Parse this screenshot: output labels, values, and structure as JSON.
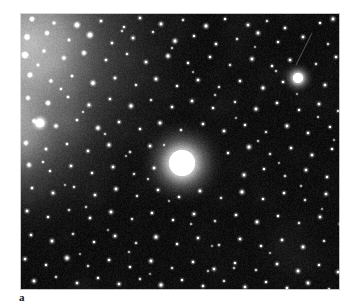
{
  "figure": {
    "panel_label": "a",
    "caption_visible": false,
    "background_color": "#ffffff"
  },
  "plate": {
    "kind": "astronomical-image",
    "frame": {
      "x": 20,
      "y": 13,
      "width": 320,
      "height": 277
    },
    "sky_background_color": "#070707",
    "star_color": "#ffffff",
    "nebulosity_color": "#8a8a8a",
    "border_color": "#d6d6d6"
  },
  "chart_data": {
    "type": "scatter",
    "title": "",
    "subtitle": "",
    "xlabel": "",
    "ylabel": "",
    "grid": false,
    "legend": null,
    "xlim": [
      0,
      320
    ],
    "ylim": [
      0,
      277
    ],
    "annotations": [
      {
        "text": "a",
        "x": 0,
        "y": -14,
        "role": "panel-label"
      }
    ],
    "background_glow": {
      "description": "broad diffuse nebulous glow in upper-left corner fading toward image centre",
      "center_x": 10,
      "center_y": 28,
      "radius": 185,
      "peak_gray": 168
    },
    "edge_glow": {
      "description": "secondary faint glow along left edge",
      "center_x": -10,
      "center_y": 120,
      "radius": 130,
      "peak_gray": 118
    },
    "streak": {
      "description": "faint linear trail (satellite or cosmic-ray) near top-right",
      "x1": 292,
      "y1": 20,
      "x2": 276,
      "y2": 52,
      "gray": 110,
      "width": 1.1
    },
    "extended_objects": [
      {
        "name": "central-bright-fuzzy-object",
        "x": 162,
        "y": 150,
        "core_radius": 13,
        "halo_radius": 46,
        "peak_gray": 255
      },
      {
        "name": "bright-star-upper-right",
        "x": 278,
        "y": 65,
        "core_radius": 5,
        "halo_radius": 17,
        "peak_gray": 255
      },
      {
        "name": "bright-star-left-edge",
        "x": 20,
        "y": 110,
        "core_radius": 3,
        "halo_radius": 10,
        "peak_gray": 235
      }
    ],
    "stars": [
      [
        12,
        6,
        1.3,
        200
      ],
      [
        34,
        10,
        1.0,
        170
      ],
      [
        57,
        12,
        1.6,
        230
      ],
      [
        81,
        8,
        1.1,
        180
      ],
      [
        104,
        14,
        1.0,
        160
      ],
      [
        120,
        5,
        1.2,
        190
      ],
      [
        141,
        11,
        1.4,
        210
      ],
      [
        163,
        7,
        1.0,
        165
      ],
      [
        186,
        13,
        1.5,
        225
      ],
      [
        205,
        6,
        1.1,
        175
      ],
      [
        228,
        12,
        1.3,
        200
      ],
      [
        247,
        8,
        1.0,
        160
      ],
      [
        265,
        15,
        1.2,
        185
      ],
      [
        300,
        10,
        1.1,
        175
      ],
      [
        313,
        6,
        1.4,
        215
      ],
      [
        7,
        24,
        1.4,
        210
      ],
      [
        27,
        20,
        1.2,
        185
      ],
      [
        49,
        27,
        1.0,
        165
      ],
      [
        70,
        22,
        1.7,
        240
      ],
      [
        92,
        30,
        1.1,
        175
      ],
      [
        113,
        25,
        1.3,
        200
      ],
      [
        133,
        19,
        1.0,
        160
      ],
      [
        155,
        28,
        1.5,
        220
      ],
      [
        174,
        23,
        1.1,
        180
      ],
      [
        196,
        31,
        1.2,
        190
      ],
      [
        217,
        26,
        1.0,
        165
      ],
      [
        238,
        20,
        1.4,
        210
      ],
      [
        258,
        29,
        1.1,
        175
      ],
      [
        283,
        24,
        1.3,
        200
      ],
      [
        308,
        31,
        1.0,
        160
      ],
      [
        325,
        27,
        1.2,
        190
      ],
      [
        5,
        42,
        1.6,
        230
      ],
      [
        24,
        38,
        1.0,
        160
      ],
      [
        44,
        45,
        1.2,
        190
      ],
      [
        64,
        40,
        1.4,
        210
      ],
      [
        86,
        47,
        1.1,
        175
      ],
      [
        107,
        41,
        1.0,
        160
      ],
      [
        126,
        49,
        1.3,
        200
      ],
      [
        148,
        43,
        1.5,
        220
      ],
      [
        168,
        50,
        1.1,
        180
      ],
      [
        190,
        44,
        1.2,
        190
      ],
      [
        210,
        52,
        1.0,
        165
      ],
      [
        232,
        46,
        1.4,
        210
      ],
      [
        252,
        53,
        1.1,
        175
      ],
      [
        270,
        47,
        1.3,
        200
      ],
      [
        296,
        51,
        1.0,
        160
      ],
      [
        316,
        44,
        1.2,
        190
      ],
      [
        10,
        62,
        1.3,
        200
      ],
      [
        31,
        68,
        1.1,
        180
      ],
      [
        52,
        63,
        1.0,
        160
      ],
      [
        73,
        70,
        1.5,
        225
      ],
      [
        95,
        65,
        1.2,
        190
      ],
      [
        116,
        72,
        1.0,
        165
      ],
      [
        136,
        66,
        1.4,
        210
      ],
      [
        157,
        73,
        1.1,
        175
      ],
      [
        178,
        67,
        1.3,
        200
      ],
      [
        199,
        74,
        1.0,
        160
      ],
      [
        220,
        68,
        1.2,
        190
      ],
      [
        243,
        75,
        1.4,
        210
      ],
      [
        263,
        69,
        1.1,
        180
      ],
      [
        305,
        72,
        1.3,
        200
      ],
      [
        322,
        66,
        1.0,
        165
      ],
      [
        8,
        85,
        1.2,
        190
      ],
      [
        28,
        90,
        1.4,
        210
      ],
      [
        48,
        84,
        1.0,
        160
      ],
      [
        69,
        92,
        1.3,
        200
      ],
      [
        90,
        86,
        1.1,
        175
      ],
      [
        111,
        93,
        1.5,
        220
      ],
      [
        131,
        87,
        1.0,
        160
      ],
      [
        152,
        94,
        1.2,
        190
      ],
      [
        172,
        88,
        1.3,
        200
      ],
      [
        193,
        95,
        1.1,
        180
      ],
      [
        215,
        89,
        1.0,
        165
      ],
      [
        236,
        96,
        1.4,
        210
      ],
      [
        257,
        90,
        1.2,
        190
      ],
      [
        279,
        97,
        1.1,
        175
      ],
      [
        299,
        91,
        1.3,
        200
      ],
      [
        318,
        98,
        1.0,
        160
      ],
      [
        14,
        108,
        1.1,
        180
      ],
      [
        36,
        113,
        1.3,
        200
      ],
      [
        57,
        107,
        1.0,
        160
      ],
      [
        78,
        115,
        1.5,
        225
      ],
      [
        99,
        109,
        1.2,
        190
      ],
      [
        120,
        116,
        1.1,
        175
      ],
      [
        140,
        110,
        1.4,
        210
      ],
      [
        161,
        117,
        1.0,
        165
      ],
      [
        183,
        111,
        1.2,
        190
      ],
      [
        204,
        118,
        1.3,
        200
      ],
      [
        225,
        112,
        1.1,
        180
      ],
      [
        246,
        119,
        1.0,
        160
      ],
      [
        267,
        113,
        1.4,
        210
      ],
      [
        288,
        120,
        1.2,
        190
      ],
      [
        310,
        114,
        1.1,
        175
      ],
      [
        327,
        121,
        1.3,
        200
      ],
      [
        6,
        130,
        1.3,
        200
      ],
      [
        26,
        136,
        1.1,
        175
      ],
      [
        47,
        131,
        1.0,
        160
      ],
      [
        68,
        138,
        1.2,
        190
      ],
      [
        89,
        132,
        1.4,
        210
      ],
      [
        110,
        139,
        1.0,
        165
      ],
      [
        130,
        133,
        1.3,
        200
      ],
      [
        208,
        140,
        1.1,
        180
      ],
      [
        229,
        134,
        1.5,
        225
      ],
      [
        250,
        141,
        1.0,
        160
      ],
      [
        271,
        135,
        1.2,
        190
      ],
      [
        292,
        142,
        1.3,
        200
      ],
      [
        312,
        136,
        1.1,
        175
      ],
      [
        9,
        152,
        1.4,
        210
      ],
      [
        30,
        158,
        1.0,
        160
      ],
      [
        51,
        153,
        1.2,
        190
      ],
      [
        72,
        160,
        1.1,
        180
      ],
      [
        93,
        154,
        1.3,
        200
      ],
      [
        114,
        161,
        1.0,
        165
      ],
      [
        134,
        155,
        1.2,
        190
      ],
      [
        224,
        162,
        1.4,
        210
      ],
      [
        244,
        156,
        1.1,
        175
      ],
      [
        265,
        163,
        1.0,
        160
      ],
      [
        286,
        157,
        1.3,
        200
      ],
      [
        307,
        164,
        1.2,
        190
      ],
      [
        324,
        158,
        1.1,
        180
      ],
      [
        12,
        175,
        1.1,
        180
      ],
      [
        33,
        180,
        1.3,
        200
      ],
      [
        54,
        174,
        1.0,
        160
      ],
      [
        75,
        182,
        1.2,
        190
      ],
      [
        96,
        176,
        1.4,
        210
      ],
      [
        117,
        183,
        1.0,
        165
      ],
      [
        138,
        177,
        1.2,
        190
      ],
      [
        159,
        184,
        1.1,
        175
      ],
      [
        180,
        178,
        1.3,
        200
      ],
      [
        201,
        185,
        1.0,
        160
      ],
      [
        222,
        179,
        1.5,
        225
      ],
      [
        243,
        186,
        1.1,
        180
      ],
      [
        264,
        180,
        1.2,
        190
      ],
      [
        285,
        187,
        1.0,
        165
      ],
      [
        306,
        181,
        1.3,
        200
      ],
      [
        326,
        188,
        1.1,
        175
      ],
      [
        7,
        198,
        1.3,
        200
      ],
      [
        28,
        204,
        1.1,
        180
      ],
      [
        49,
        197,
        1.0,
        160
      ],
      [
        70,
        205,
        1.2,
        190
      ],
      [
        91,
        199,
        1.4,
        210
      ],
      [
        112,
        206,
        1.0,
        165
      ],
      [
        132,
        200,
        1.2,
        190
      ],
      [
        153,
        207,
        1.1,
        175
      ],
      [
        174,
        201,
        1.3,
        200
      ],
      [
        195,
        208,
        1.0,
        160
      ],
      [
        216,
        202,
        1.2,
        190
      ],
      [
        237,
        209,
        1.4,
        210
      ],
      [
        258,
        203,
        1.1,
        180
      ],
      [
        279,
        210,
        1.0,
        165
      ],
      [
        300,
        204,
        1.3,
        200
      ],
      [
        320,
        211,
        1.1,
        175
      ],
      [
        11,
        222,
        1.2,
        190
      ],
      [
        32,
        228,
        1.4,
        210
      ],
      [
        53,
        221,
        1.0,
        160
      ],
      [
        74,
        229,
        1.1,
        180
      ],
      [
        95,
        223,
        1.3,
        200
      ],
      [
        116,
        230,
        1.0,
        165
      ],
      [
        136,
        224,
        1.5,
        225
      ],
      [
        157,
        231,
        1.1,
        175
      ],
      [
        178,
        225,
        1.2,
        190
      ],
      [
        199,
        232,
        1.0,
        160
      ],
      [
        220,
        226,
        1.3,
        200
      ],
      [
        241,
        233,
        1.1,
        180
      ],
      [
        262,
        227,
        1.2,
        190
      ],
      [
        283,
        234,
        1.4,
        210
      ],
      [
        304,
        228,
        1.0,
        165
      ],
      [
        323,
        235,
        1.1,
        175
      ],
      [
        5,
        246,
        1.3,
        200
      ],
      [
        26,
        252,
        1.1,
        180
      ],
      [
        47,
        245,
        1.6,
        235
      ],
      [
        68,
        253,
        1.0,
        160
      ],
      [
        89,
        247,
        1.2,
        190
      ],
      [
        110,
        254,
        1.1,
        175
      ],
      [
        131,
        248,
        1.4,
        210
      ],
      [
        152,
        255,
        1.0,
        165
      ],
      [
        173,
        249,
        1.2,
        190
      ],
      [
        194,
        256,
        1.3,
        200
      ],
      [
        215,
        250,
        1.1,
        180
      ],
      [
        236,
        257,
        1.0,
        160
      ],
      [
        257,
        251,
        1.2,
        190
      ],
      [
        278,
        258,
        1.4,
        210
      ],
      [
        299,
        252,
        1.1,
        175
      ],
      [
        318,
        259,
        1.3,
        200
      ],
      [
        14,
        268,
        1.4,
        215
      ],
      [
        36,
        264,
        1.0,
        160
      ],
      [
        57,
        270,
        1.2,
        190
      ],
      [
        78,
        265,
        1.1,
        175
      ],
      [
        99,
        271,
        1.3,
        200
      ],
      [
        120,
        266,
        1.0,
        165
      ],
      [
        141,
        272,
        1.5,
        225
      ],
      [
        162,
        267,
        1.1,
        180
      ],
      [
        183,
        273,
        1.2,
        190
      ],
      [
        204,
        268,
        1.0,
        160
      ],
      [
        225,
        274,
        1.3,
        200
      ],
      [
        246,
        269,
        1.1,
        175
      ],
      [
        267,
        275,
        1.2,
        190
      ],
      [
        288,
        270,
        1.4,
        210
      ],
      [
        309,
        276,
        1.0,
        165
      ],
      [
        330,
        271,
        1.1,
        180
      ],
      [
        18,
        52,
        0.9,
        140
      ],
      [
        41,
        76,
        0.9,
        145
      ],
      [
        63,
        99,
        0.8,
        130
      ],
      [
        85,
        121,
        0.9,
        140
      ],
      [
        106,
        143,
        0.8,
        125
      ],
      [
        128,
        166,
        0.9,
        145
      ],
      [
        149,
        188,
        0.8,
        130
      ],
      [
        171,
        211,
        0.9,
        140
      ],
      [
        192,
        233,
        0.8,
        125
      ],
      [
        214,
        255,
        0.9,
        145
      ],
      [
        235,
        34,
        0.8,
        130
      ],
      [
        256,
        58,
        0.9,
        140
      ],
      [
        277,
        81,
        0.8,
        125
      ],
      [
        298,
        104,
        0.9,
        145
      ],
      [
        314,
        127,
        0.8,
        130
      ],
      [
        23,
        149,
        0.9,
        140
      ],
      [
        45,
        172,
        0.8,
        125
      ],
      [
        66,
        194,
        0.9,
        145
      ],
      [
        88,
        217,
        0.8,
        130
      ],
      [
        109,
        239,
        0.9,
        140
      ],
      [
        130,
        261,
        0.8,
        125
      ],
      [
        152,
        35,
        0.9,
        145
      ],
      [
        173,
        59,
        0.8,
        130
      ],
      [
        195,
        82,
        0.9,
        140
      ],
      [
        216,
        105,
        0.8,
        125
      ],
      [
        238,
        128,
        0.9,
        145
      ],
      [
        259,
        150,
        0.8,
        130
      ],
      [
        281,
        173,
        0.9,
        140
      ],
      [
        302,
        196,
        0.8,
        125
      ],
      [
        321,
        218,
        0.9,
        145
      ],
      [
        60,
        241,
        0.8,
        130
      ],
      [
        102,
        18,
        0.9,
        140
      ],
      [
        144,
        132,
        0.8,
        125
      ],
      [
        188,
        258,
        0.9,
        145
      ],
      [
        250,
        240,
        0.8,
        130
      ]
    ]
  }
}
